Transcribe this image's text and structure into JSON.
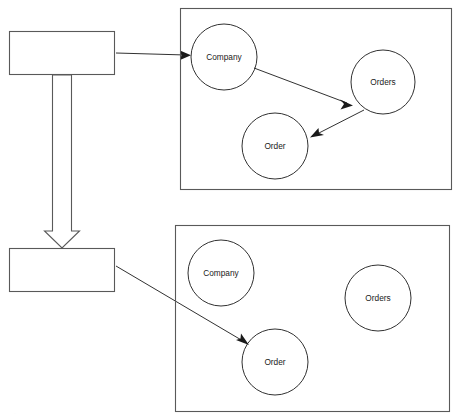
{
  "diagram": {
    "canvas": {
      "width": 460,
      "height": 420,
      "background": "#ffffff"
    },
    "colors": {
      "box_stroke": "#595959",
      "circle_stroke": "#1a1a1a",
      "edge_stroke": "#1a1a1a",
      "label_text": "#1a1a1a",
      "fill": "#ffffff"
    },
    "left_boxes": [
      {
        "id": "source-box",
        "label": "",
        "x": 9,
        "y": 31,
        "width": 106,
        "height": 44
      },
      {
        "id": "target-box",
        "label": "",
        "x": 9,
        "y": 248,
        "width": 106,
        "height": 44
      }
    ],
    "block_arrow": {
      "id": "transform-block-arrow",
      "direction": "down",
      "from_box": "source-box",
      "to_box": "target-box",
      "shaft_left": 52,
      "shaft_right": 72,
      "head_left": 44,
      "head_right": 80,
      "top_y": 75,
      "head_top_y": 231,
      "tip_y": 248
    },
    "panels": [
      {
        "id": "top-graph-panel",
        "x": 180,
        "y": 8,
        "width": 272,
        "height": 182,
        "nodes": [
          {
            "id": "top-company",
            "label": "Company",
            "cx": 224,
            "cy": 57,
            "r": 33
          },
          {
            "id": "top-orders",
            "label": "Orders",
            "cx": 383,
            "cy": 82,
            "r": 32
          },
          {
            "id": "top-order",
            "label": "Order",
            "cx": 275,
            "cy": 146,
            "r": 33
          }
        ],
        "edges": [
          {
            "id": "edge-company-orders",
            "from": "top-company",
            "to": "top-orders",
            "label": ""
          },
          {
            "id": "edge-orders-order",
            "from": "top-orders",
            "to": "top-order",
            "label": ""
          }
        ]
      },
      {
        "id": "bottom-graph-panel",
        "x": 175,
        "y": 225,
        "width": 275,
        "height": 187,
        "nodes": [
          {
            "id": "bottom-company",
            "label": "Company",
            "cx": 221,
            "cy": 273,
            "r": 33
          },
          {
            "id": "bottom-orders",
            "label": "Orders",
            "cx": 378,
            "cy": 298,
            "r": 33
          },
          {
            "id": "bottom-order",
            "label": "Order",
            "cx": 275,
            "cy": 362,
            "r": 33
          }
        ],
        "edges": []
      }
    ],
    "connectors": [
      {
        "id": "connector-source-to-top-company",
        "from": "source-box",
        "to": "top-company",
        "x1": 116,
        "y1": 53,
        "x2": 190,
        "y2": 55,
        "label": ""
      },
      {
        "id": "connector-target-to-bottom-order",
        "from": "target-box",
        "to": "bottom-order",
        "x1": 116,
        "y1": 266,
        "x2": 247,
        "y2": 344,
        "label": ""
      }
    ],
    "artifact_text": "."
  }
}
